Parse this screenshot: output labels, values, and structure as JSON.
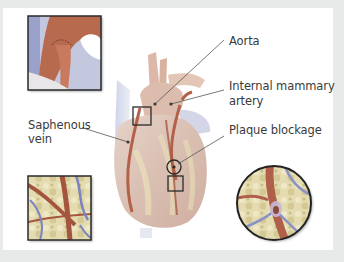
{
  "figure": {
    "colors": {
      "background": "#e8eae9",
      "panel": "#ffffff",
      "label_text": "#3a3a3a",
      "leader_line": "#555555",
      "artery_red": "#b4614a",
      "heart_tissue": "#dcc3b6",
      "fat_yellow": "#e6dcaa",
      "vein_blue": "#8c96c8",
      "inset_border": "#2a2a2a"
    },
    "labels": {
      "aorta": "Aorta",
      "internal_mammary_line1": "Internal mammary",
      "internal_mammary_line2": "artery",
      "plaque_blockage": "Plaque blockage",
      "saphenous_line1": "Saphenous",
      "saphenous_line2": "vein"
    },
    "insets": [
      {
        "name": "graft-anastomosis-inset",
        "shape": "square"
      },
      {
        "name": "saphenous-graft-inset",
        "shape": "square"
      },
      {
        "name": "plaque-blockage-inset",
        "shape": "circle"
      }
    ]
  }
}
